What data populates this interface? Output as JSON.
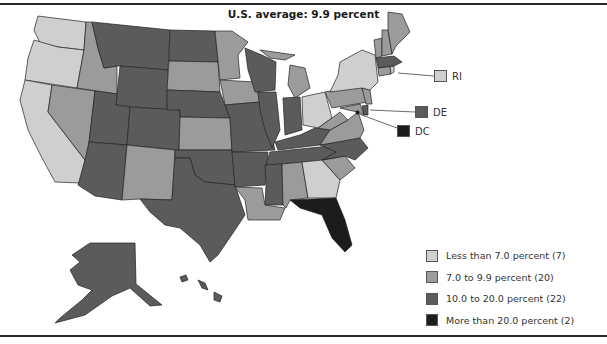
{
  "title": "U.S. average: 9.9 percent",
  "colors": {
    "less_than_7": "#cfcfcf",
    "7_to_9_9": "#9b9b9b",
    "10_to_20": "#5b5b5b",
    "more_than_20": "#1c1c1c",
    "border": "#222222",
    "rule": "#2a2a2a"
  },
  "legend": [
    {
      "label": "Less than 7.0 percent (7)",
      "bin": "less_than_7",
      "count": 7
    },
    {
      "label": "7.0 to 9.9 percent (20)",
      "bin": "7_to_9_9",
      "count": 20
    },
    {
      "label": "10.0 to 20.0 percent (22)",
      "bin": "10_to_20",
      "count": 22
    },
    {
      "label": "More than 20.0 percent (2)",
      "bin": "more_than_20",
      "count": 2
    }
  ],
  "callouts": [
    {
      "label": "RI",
      "bin": "less_than_7"
    },
    {
      "label": "DE",
      "bin": "10_to_20"
    },
    {
      "label": "DC",
      "bin": "more_than_20"
    }
  ],
  "states": {
    "less_than_7": [
      "WA",
      "OR",
      "CA",
      "NY",
      "OH",
      "GA",
      "RI"
    ],
    "7_to_9_9": [
      "ID",
      "NV",
      "NM",
      "SD",
      "MN",
      "IA",
      "KS",
      "MI",
      "PA",
      "NJ",
      "VA",
      "WV",
      "SC",
      "AL",
      "LA",
      "ME",
      "NH",
      "VT",
      "CT",
      "MD"
    ],
    "10_to_20": [
      "MT",
      "WY",
      "CO",
      "ND",
      "NE",
      "OK",
      "TX",
      "MO",
      "AR",
      "WI",
      "IL",
      "IN",
      "KY",
      "TN",
      "MS",
      "NC",
      "AZ",
      "AK",
      "HI",
      "MA",
      "DE",
      "UT"
    ],
    "more_than_20": [
      "FL",
      "DC"
    ]
  }
}
